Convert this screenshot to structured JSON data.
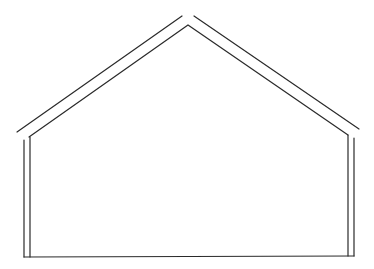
{
  "diagram": {
    "title": "",
    "type": "house-outline",
    "stroke_color": "#2a2a2a",
    "background": "#ffffff",
    "lines": {
      "roof_outer_left": {
        "x1": 17,
        "y1": 132,
        "x2": 182,
        "y2": 16
      },
      "roof_outer_right": {
        "x1": 194,
        "y1": 16,
        "x2": 359,
        "y2": 129
      },
      "roof_inner": {
        "points": "29,137 188,25 348,135"
      },
      "wall_left_outer": {
        "x1": 24,
        "y1": 140,
        "x2": 24,
        "y2": 257
      },
      "wall_left_inner": {
        "x1": 30,
        "y1": 137,
        "x2": 30,
        "y2": 257
      },
      "wall_right_outer": {
        "x1": 354,
        "y1": 138,
        "x2": 354,
        "y2": 256
      },
      "wall_right_inner": {
        "x1": 348,
        "y1": 135,
        "x2": 348,
        "y2": 256
      },
      "floor": {
        "x1": 24,
        "y1": 257,
        "x2": 354,
        "y2": 256
      }
    }
  }
}
